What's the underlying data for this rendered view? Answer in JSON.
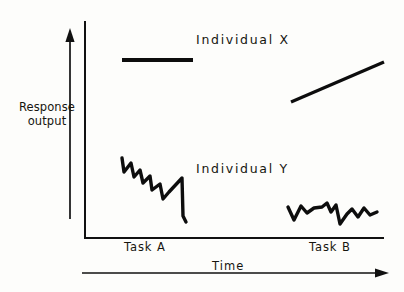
{
  "chart_data": {
    "type": "line",
    "title": "",
    "xlabel": "Time",
    "ylabel": "Response output",
    "grid": false,
    "legend": "inline-annotations",
    "xlim": [
      0,
      100
    ],
    "ylim": [
      0,
      100
    ],
    "phase_labels": [
      "Task A",
      "Task B"
    ],
    "annotations": [
      "Individual X",
      "Individual Y"
    ],
    "series": [
      {
        "name": "Individual X",
        "label": "Individual X",
        "segments": [
          {
            "phase": "Task A",
            "shape": "flat",
            "points": [
              [
                122,
                60
              ],
              [
                193,
                60
              ]
            ]
          },
          {
            "phase": "Task B",
            "shape": "rising",
            "points": [
              [
                291,
                102
              ],
              [
                384,
                62
              ]
            ]
          }
        ]
      },
      {
        "name": "Individual Y",
        "label": "Individual Y",
        "segments": [
          {
            "phase": "Task A",
            "shape": "descending-sawtooth",
            "points": [
              [
                122,
                158
              ],
              [
                124,
                172
              ],
              [
                131,
                163
              ],
              [
                134,
                177
              ],
              [
                140,
                170
              ],
              [
                143,
                183
              ],
              [
                150,
                176
              ],
              [
                152,
                190
              ],
              [
                160,
                184
              ],
              [
                163,
                199
              ],
              [
                169,
                192
              ],
              [
                182,
                178
              ],
              [
                183,
                216
              ],
              [
                186,
                222
              ]
            ]
          },
          {
            "phase": "Task B",
            "shape": "flat-variable",
            "points": [
              [
                288,
                207
              ],
              [
                294,
                220
              ],
              [
                301,
                206
              ],
              [
                307,
                213
              ],
              [
                314,
                208
              ],
              [
                322,
                207
              ],
              [
                327,
                203
              ],
              [
                331,
                212
              ],
              [
                336,
                205
              ],
              [
                340,
                224
              ],
              [
                347,
                214
              ],
              [
                352,
                209
              ],
              [
                358,
                217
              ],
              [
                364,
                208
              ],
              [
                370,
                215
              ],
              [
                377,
                212
              ]
            ]
          }
        ]
      }
    ]
  },
  "axes": {
    "y_axis_label_line1": "Response",
    "y_axis_label_line2": "output",
    "x_axis_label": "Time",
    "y_direction_arrow": "up-arrow-icon",
    "x_direction_arrow": "right-arrow-icon"
  },
  "labels": {
    "individual_x": "Individual X",
    "individual_y": "Individual Y",
    "task_a": "Task A",
    "task_b": "Task B"
  },
  "colors": {
    "ink": "#0d0d0d",
    "background": "#fdfdfb"
  }
}
